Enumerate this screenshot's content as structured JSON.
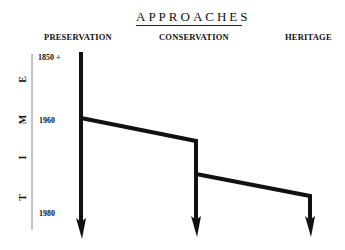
{
  "title": "APPROACHES",
  "columns": [
    {
      "label": "PRESERVATION"
    },
    {
      "label": "CONSERVATION"
    },
    {
      "label": "HERITAGE"
    }
  ],
  "axis": {
    "label_letters": [
      "T",
      "I",
      "M",
      "E"
    ],
    "years": [
      "1850 +",
      "1960",
      "1980"
    ]
  },
  "colors": {
    "line": "#111111",
    "text": "#111111"
  }
}
